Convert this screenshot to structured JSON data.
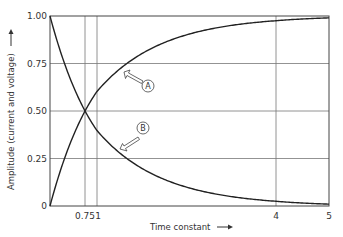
{
  "chart_data": {
    "type": "line",
    "title": "",
    "xlabel": "Time constant",
    "ylabel": "Amplitude (current and voltage)",
    "xlim": [
      0,
      5
    ],
    "ylim": [
      0,
      1
    ],
    "x_ticks": [
      {
        "value": 0.75,
        "label": "0.75"
      },
      {
        "value": 1,
        "label": "1"
      },
      {
        "value": 4,
        "label": "4"
      },
      {
        "value": 5,
        "label": "5"
      }
    ],
    "y_ticks": [
      {
        "value": 0,
        "label": "0"
      },
      {
        "value": 0.25,
        "label": "0.25"
      },
      {
        "value": 0.5,
        "label": "0.50"
      },
      {
        "value": 0.75,
        "label": "0.75"
      },
      {
        "value": 1,
        "label": "1.00"
      }
    ],
    "grid": true,
    "legend": "none",
    "series": [
      {
        "name": "A",
        "description": "rising curve (1 - e^-t)",
        "x": [
          0,
          0.25,
          0.5,
          0.75,
          1,
          1.5,
          2,
          2.5,
          3,
          3.5,
          4,
          4.5,
          5
        ],
        "values": [
          0,
          0.22,
          0.39,
          0.5,
          0.63,
          0.78,
          0.86,
          0.92,
          0.95,
          0.97,
          0.98,
          0.99,
          0.99
        ]
      },
      {
        "name": "B",
        "description": "decaying curve (e^-t)",
        "x": [
          0,
          0.25,
          0.5,
          0.75,
          1,
          1.5,
          2,
          2.5,
          3,
          3.5,
          4,
          4.5,
          5
        ],
        "values": [
          1,
          0.78,
          0.61,
          0.5,
          0.37,
          0.22,
          0.14,
          0.08,
          0.05,
          0.03,
          0.02,
          0.01,
          0.01
        ]
      }
    ],
    "annotations": [
      {
        "label": "A",
        "target_series": "A",
        "arrow": "hollow arrow pointing up-left to rising curve"
      },
      {
        "label": "B",
        "target_series": "B",
        "arrow": "hollow arrow pointing down-left to decaying curve"
      }
    ]
  },
  "labels": {
    "xlabel": "Time constant",
    "ylabel": "Amplitude (current and voltage)",
    "callout_a": "A",
    "callout_b": "B"
  }
}
